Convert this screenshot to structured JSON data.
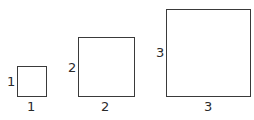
{
  "diagram": {
    "squares": [
      {
        "side_label": "1",
        "bottom_label": "1"
      },
      {
        "side_label": "2",
        "bottom_label": "2"
      },
      {
        "side_label": "3",
        "bottom_label": "3"
      }
    ],
    "colors": {
      "stroke": "#3a3a3a",
      "text": "#2a2a2a",
      "background": "#ffffff"
    }
  }
}
